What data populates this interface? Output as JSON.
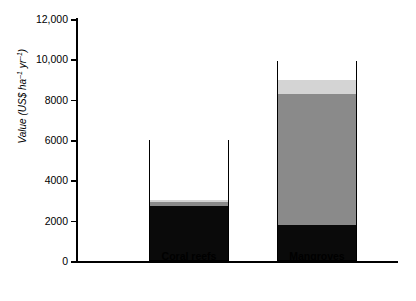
{
  "chart_data": {
    "type": "bar",
    "title": "",
    "subtitle": "",
    "xlabel": "",
    "ylabel_parts": {
      "main": "Value (US$ ha",
      "sup1": "–1",
      "mid": " yr",
      "sup2": "–1",
      "close": ")"
    },
    "ylabel": "Value (US$ ha-1 yr-1)",
    "categories": [
      "Coral reefs",
      "Mangroves"
    ],
    "ylim": [
      0,
      12000
    ],
    "yticks": [
      0,
      2000,
      4000,
      6000,
      8000,
      10000,
      12000
    ],
    "ytick_labels": [
      "0",
      "2000",
      "4000",
      "6000",
      "8000",
      "10,000",
      "12,000"
    ],
    "grid": false,
    "legend": "none",
    "stacked": true,
    "series": [
      {
        "name": "black-segment",
        "color": "#0a0a0a",
        "values": [
          2700,
          1750
        ]
      },
      {
        "name": "dark-grey-segment",
        "color": "#8a8a8a",
        "values": [
          170,
          6500
        ]
      },
      {
        "name": "light-grey-segment",
        "color": "#d4d4d4",
        "values": [
          130,
          700
        ]
      },
      {
        "name": "white-segment",
        "color": "#ffffff",
        "values": [
          3000,
          950
        ]
      }
    ],
    "totals": [
      6000,
      9900
    ]
  }
}
